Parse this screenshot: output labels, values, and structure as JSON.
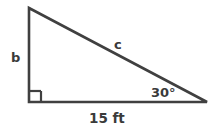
{
  "figure": {
    "type": "right-triangle-diagram",
    "background_color": "#ffffff",
    "stroke_color": "#404040",
    "text_color": "#3a3a3a",
    "labels": {
      "vertical_leg": "b",
      "hypotenuse": "c",
      "angle": "30°",
      "base": "15 ft"
    },
    "right_angle_marker": "right-angle-square",
    "vertices": {
      "top": [
        29,
        8
      ],
      "bottom_left": [
        29,
        102
      ],
      "bottom_right": [
        207,
        102
      ]
    }
  }
}
